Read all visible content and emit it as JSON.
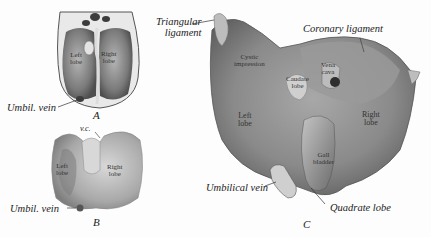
{
  "figure": {
    "panels": [
      {
        "id": "A",
        "caption": "A",
        "external_labels": {
          "umbil_vein": "Umbil. vein"
        },
        "internal_labels": {
          "left_lobe": "Left\nlobe",
          "right_lobe": "Right\nlobe"
        }
      },
      {
        "id": "B",
        "caption": "B",
        "external_labels": {
          "umbil_vein": "Umbil. vein",
          "vc": "v.c."
        },
        "internal_labels": {
          "left_lobe": "Left\nlobe",
          "right_lobe": "Right\nlobe"
        }
      },
      {
        "id": "C",
        "caption": "C",
        "external_labels": {
          "triangular_ligament": "Triangular\nligament",
          "coronary_ligament": "Coronary ligament",
          "umbilical_vein": "Umbilical vein",
          "quadrate_lobe": "Quadrate lobe"
        },
        "internal_labels": {
          "cystic_impression": "Cystic\nimpression",
          "caudate_lobe": "Caudate\nlobe",
          "vena_cava": "Vena\ncava",
          "left_lobe": "Left\nlobe",
          "right_lobe": "Right\nlobe",
          "gall_bladder": "Gall\nbladder"
        }
      }
    ],
    "colors": {
      "background": "#fdfdfd",
      "tissue_dark": "#6a6a6a",
      "tissue_mid": "#9a9a9a",
      "tissue_light": "#cfcfcf",
      "ink": "#222222"
    }
  }
}
